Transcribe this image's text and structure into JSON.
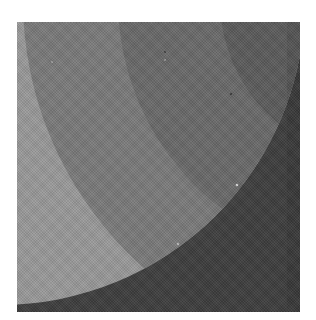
{
  "image": {
    "description": "Grayscale abstract print of overlapping concentric arcs",
    "frame": {
      "left": 17,
      "top": 22,
      "width": 283,
      "height": 290
    },
    "colors": {
      "background": "#ffffff",
      "band_light": "#9a9a9a",
      "band_medium": "#7b7b7b",
      "band_darker": "#6a6a6a",
      "band_darkest": "#5c5c5c",
      "outer_region": "#3e3e3e"
    },
    "shapes": {
      "outer_arc": {
        "cx": -17,
        "cy": -22,
        "r": 305
      },
      "inner_arcs_center": {
        "cx": 363,
        "cy": -22
      },
      "band_radii": [
        357,
        262,
        160
      ]
    }
  }
}
